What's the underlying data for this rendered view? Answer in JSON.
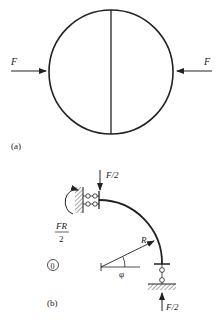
{
  "figure_a": {
    "label": "(a)",
    "left_force": "F",
    "right_force": "F"
  },
  "figure_b": {
    "label": "(b)",
    "top_force": "F/2",
    "bottom_force": "F/2",
    "moment_numerator": "FR",
    "moment_denominator": "2",
    "radius_label": "R",
    "angle_label": "φ",
    "circled_label": "0"
  },
  "colors": {
    "stroke": "#222222",
    "background": "#ffffff"
  }
}
